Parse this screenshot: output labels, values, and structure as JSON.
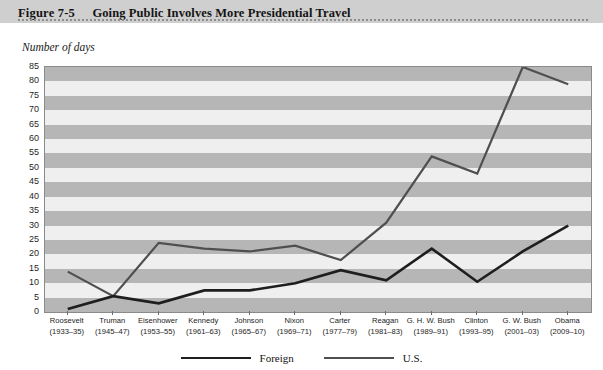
{
  "figure": {
    "number": "Figure 7-5",
    "title": "Going Public Involves More Presidential Travel"
  },
  "chart_data": {
    "type": "line",
    "title": "Going Public Involves More Presidential Travel",
    "xlabel": "",
    "ylabel": "Number of days",
    "ylim": [
      0,
      85
    ],
    "ytick_step": 5,
    "yticks": [
      "85",
      "80",
      "75",
      "70",
      "65",
      "60",
      "55",
      "50",
      "45",
      "40",
      "35",
      "30",
      "25",
      "20",
      "15",
      "10",
      "5",
      "0"
    ],
    "grid": "horizontal-banded",
    "legend_position": "bottom-center",
    "categories": [
      "Roosevelt (1933–35)",
      "Truman (1945–47)",
      "Eisenhower (1953–55)",
      "Kennedy (1961–63)",
      "Johnson (1965–67)",
      "Nixon (1969–71)",
      "Carter (1977–79)",
      "Reagan (1981–83)",
      "G. H. W. Bush (1989–91)",
      "Clinton (1993–95)",
      "G. W. Bush (2001–03)",
      "Obama (2009–10)"
    ],
    "category_parts": [
      {
        "name": "Roosevelt",
        "years": "(1933–35)"
      },
      {
        "name": "Truman",
        "years": "(1945–47)"
      },
      {
        "name": "Eisenhower",
        "years": "(1953–55)"
      },
      {
        "name": "Kennedy",
        "years": "(1961–63)"
      },
      {
        "name": "Johnson",
        "years": "(1965–67)"
      },
      {
        "name": "Nixon",
        "years": "(1969–71)"
      },
      {
        "name": "Carter",
        "years": "(1977–79)"
      },
      {
        "name": "Reagan",
        "years": "(1981–83)"
      },
      {
        "name": "G. H. W. Bush",
        "years": "(1989–91)"
      },
      {
        "name": "Clinton",
        "years": "(1993–95)"
      },
      {
        "name": "G. W. Bush",
        "years": "(2001–03)"
      },
      {
        "name": "Obama",
        "years": "(2009–10)"
      }
    ],
    "series": [
      {
        "name": "Foreign",
        "color": "#1e1e1e",
        "values": [
          1,
          5.5,
          3,
          7.5,
          7.5,
          10,
          14.5,
          11,
          22,
          10.5,
          21,
          30
        ]
      },
      {
        "name": "U.S.",
        "color": "#4f4f4f",
        "values": [
          14,
          5.5,
          24,
          22,
          21,
          23,
          18,
          31,
          54,
          48,
          85,
          79
        ]
      }
    ]
  },
  "legend": {
    "items": [
      {
        "label": "Foreign",
        "color": "#1e1e1e"
      },
      {
        "label": "U.S.",
        "color": "#4f4f4f"
      }
    ]
  },
  "colors": {
    "banner": "#cfcfcf",
    "plot_background": "#efefef",
    "band": "#b6b6b6",
    "frame": "#8a8a8a"
  }
}
